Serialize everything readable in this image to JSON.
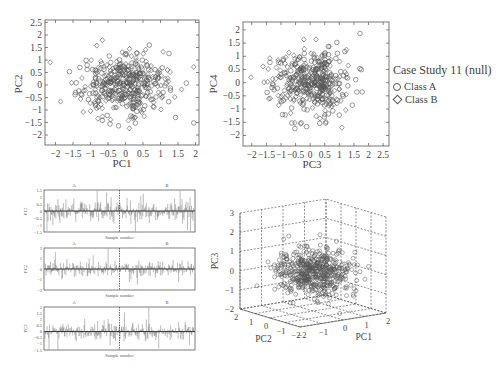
{
  "legend": {
    "title": "Case Study 11 (null)",
    "items": [
      {
        "label": "Class A",
        "marker": "circle"
      },
      {
        "label": "Class B",
        "marker": "diamond"
      }
    ]
  },
  "chart_data": [
    {
      "type": "scatter",
      "title": "",
      "xlabel": "PC1",
      "ylabel": "PC2",
      "xlim": [
        -2.3,
        2.1
      ],
      "ylim": [
        -2.4,
        2.6
      ],
      "xticks": [
        "-2",
        "-1.5",
        "-1",
        "-0.5",
        "0",
        "0.5",
        "1",
        "1.5",
        "2"
      ],
      "yticks": [
        "2.5",
        "2",
        "1.5",
        "1",
        "0.5",
        "0",
        "-0.5",
        "-1",
        "-1.5",
        "-2"
      ],
      "series": [
        {
          "name": "Class A",
          "marker": "circle",
          "distribution": "approx. normal, centered near (0,0), sd ~0.7"
        },
        {
          "name": "Class B",
          "marker": "diamond",
          "distribution": "approx. normal, centered near (0,0), sd ~0.7"
        }
      ]
    },
    {
      "type": "scatter",
      "title": "",
      "xlabel": "PC3",
      "ylabel": "PC4",
      "xlim": [
        -2.3,
        2.7
      ],
      "ylim": [
        -2.4,
        2.3
      ],
      "xticks": [
        "-2",
        "-1.5",
        "-1",
        "-0.5",
        "0",
        "0.5",
        "1",
        "1.5",
        "2",
        "2.5"
      ],
      "yticks": [
        "2",
        "1.5",
        "1",
        "0.5",
        "0",
        "-0.5",
        "-1",
        "-1.5",
        "-2"
      ],
      "series": [
        {
          "name": "Class A",
          "marker": "circle"
        },
        {
          "name": "Class B",
          "marker": "diamond"
        }
      ]
    },
    {
      "type": "line",
      "xlabel": "Sample number",
      "ylabel": "PC1",
      "segments": [
        "A",
        "B"
      ],
      "yticks": [
        "1.5",
        "1",
        "0.5",
        "0",
        "-0.5",
        "-1",
        "-1.5"
      ],
      "ylim": [
        -1.5,
        1.5
      ]
    },
    {
      "type": "line",
      "xlabel": "Sample number",
      "ylabel": "PC2",
      "segments": [
        "A",
        "B"
      ],
      "yticks": [
        "2",
        "1",
        "0",
        "-1",
        "-2"
      ],
      "ylim": [
        -2,
        2
      ]
    },
    {
      "type": "line",
      "xlabel": "Sample number",
      "ylabel": "PC3",
      "segments": [
        "A",
        "B"
      ],
      "yticks": [
        "2",
        "1.5",
        "1",
        "0.5",
        "0",
        "-0.5",
        "-1",
        "-1.5"
      ],
      "ylim": [
        -1.5,
        2
      ]
    },
    {
      "type": "scatter",
      "subtype": "3d",
      "xlabel": "PC1",
      "ylabel": "PC2",
      "zlabel": "PC3",
      "xticks": [
        "-2",
        "-1",
        "0",
        "1",
        "2"
      ],
      "yticks": [
        "2",
        "1",
        "0",
        "-1",
        "-2"
      ],
      "zticks": [
        "3",
        "2",
        "1",
        "0",
        "-1",
        "-2"
      ],
      "grid": true
    }
  ],
  "labels": {
    "pc1": "PC1",
    "pc2": "PC2",
    "pc3": "PC3",
    "pc4": "PC4",
    "sample_number": "Sample number",
    "seg_a": "A",
    "seg_b": "B"
  }
}
